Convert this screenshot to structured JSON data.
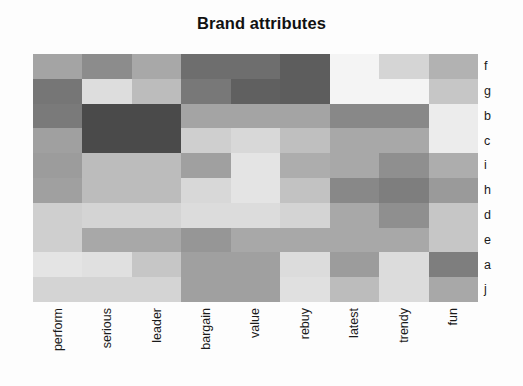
{
  "chart_data": {
    "type": "heatmap",
    "title": "Brand attributes",
    "xlabel": "",
    "ylabel": "",
    "grid": false,
    "legend": "none",
    "colormap": "grayscale",
    "colormap_note": "dark gray = high value, light gray/white = low value",
    "value_range": [
      0,
      1
    ],
    "categories": [
      "perform",
      "serious",
      "leader",
      "bargain",
      "value",
      "rebuy",
      "latest",
      "trendy",
      "fun"
    ],
    "row_labels": [
      "f",
      "g",
      "b",
      "c",
      "i",
      "h",
      "d",
      "e",
      "a",
      "j"
    ],
    "series": [
      {
        "name": "f",
        "values": [
          0.42,
          0.55,
          0.4,
          0.72,
          0.72,
          0.8,
          0.06,
          0.22,
          0.36
        ]
      },
      {
        "name": "g",
        "values": [
          0.7,
          0.18,
          0.3,
          0.62,
          0.78,
          0.8,
          0.06,
          0.06,
          0.28
        ]
      },
      {
        "name": "b",
        "values": [
          0.68,
          0.88,
          0.88,
          0.42,
          0.42,
          0.42,
          0.58,
          0.58,
          0.1
        ]
      },
      {
        "name": "c",
        "values": [
          0.44,
          0.88,
          0.88,
          0.22,
          0.18,
          0.28,
          0.4,
          0.4,
          0.1
        ]
      },
      {
        "name": "i",
        "values": [
          0.46,
          0.3,
          0.3,
          0.44,
          0.12,
          0.38,
          0.4,
          0.56,
          0.38
        ]
      },
      {
        "name": "h",
        "values": [
          0.44,
          0.3,
          0.3,
          0.18,
          0.12,
          0.26,
          0.58,
          0.66,
          0.48
        ]
      },
      {
        "name": "d",
        "values": [
          0.22,
          0.2,
          0.2,
          0.16,
          0.16,
          0.2,
          0.4,
          0.56,
          0.26
        ]
      },
      {
        "name": "e",
        "values": [
          0.22,
          0.4,
          0.4,
          0.5,
          0.4,
          0.4,
          0.4,
          0.4,
          0.26
        ]
      },
      {
        "name": "a",
        "values": [
          0.12,
          0.14,
          0.26,
          0.44,
          0.44,
          0.16,
          0.48,
          0.16,
          0.62
        ]
      },
      {
        "name": "j",
        "values": [
          0.2,
          0.2,
          0.2,
          0.44,
          0.44,
          0.14,
          0.3,
          0.18,
          0.4
        ]
      }
    ],
    "cell_colors": [
      [
        "#a4a4a4",
        "#8c8c8c",
        "#a8a8a8",
        "#6e6e6e",
        "#6e6e6e",
        "#5d5d5d",
        "#f4f4f4",
        "#d5d5d5",
        "#b2b2b2"
      ],
      [
        "#767676",
        "#dddddd",
        "#bcbcbc",
        "#787878",
        "#606060",
        "#5d5d5d",
        "#f4f4f4",
        "#f4f4f4",
        "#c6c6c6"
      ],
      [
        "#7a7a7a",
        "#4a4a4a",
        "#4a4a4a",
        "#a4a4a4",
        "#a4a4a4",
        "#a4a4a4",
        "#888888",
        "#888888",
        "#ececec"
      ],
      [
        "#a0a0a0",
        "#4a4a4a",
        "#4a4a4a",
        "#cfcfcf",
        "#d8d8d8",
        "#bfbfbf",
        "#a8a8a8",
        "#a8a8a8",
        "#ececec"
      ],
      [
        "#9c9c9c",
        "#bcbcbc",
        "#bcbcbc",
        "#a0a0a0",
        "#e4e4e4",
        "#adadad",
        "#a8a8a8",
        "#8f8f8f",
        "#adadad"
      ],
      [
        "#a0a0a0",
        "#bcbcbc",
        "#bcbcbc",
        "#d8d8d8",
        "#e4e4e4",
        "#c2c2c2",
        "#888888",
        "#7e7e7e",
        "#9a9a9a"
      ],
      [
        "#cfcfcf",
        "#d4d4d4",
        "#d4d4d4",
        "#dcdcdc",
        "#dcdcdc",
        "#d4d4d4",
        "#a8a8a8",
        "#8f8f8f",
        "#c6c6c6"
      ],
      [
        "#cfcfcf",
        "#a8a8a8",
        "#a8a8a8",
        "#969696",
        "#a8a8a8",
        "#a8a8a8",
        "#a8a8a8",
        "#a8a8a8",
        "#c6c6c6"
      ],
      [
        "#e4e4e4",
        "#e0e0e0",
        "#c6c6c6",
        "#a0a0a0",
        "#a0a0a0",
        "#dcdcdc",
        "#9c9c9c",
        "#dcdcdc",
        "#7e7e7e"
      ],
      [
        "#d4d4d4",
        "#d4d4d4",
        "#d4d4d4",
        "#a0a0a0",
        "#a0a0a0",
        "#e0e0e0",
        "#bcbcbc",
        "#dcdcdc",
        "#a8a8a8"
      ]
    ]
  }
}
